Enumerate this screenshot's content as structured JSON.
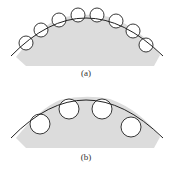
{
  "figures": [
    {
      "id": "a",
      "label": "(a)",
      "description": "Curved arc with 8 small circles arranged along its inner edge over a gray region",
      "circle_count": 8
    },
    {
      "id": "b",
      "label": "(b)",
      "description": "Curved arc with 4 larger circles arranged below its inner edge over a gray region",
      "circle_count": 4
    }
  ],
  "colors": {
    "fill": "#dcdcdc",
    "stroke": "#222222",
    "background": "#ffffff"
  }
}
